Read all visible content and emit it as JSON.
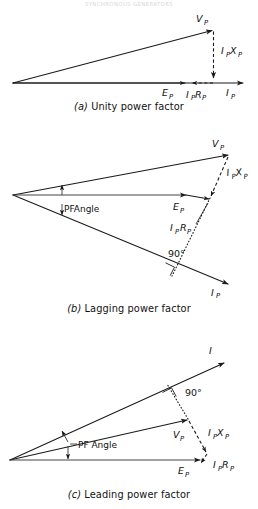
{
  "header": {
    "running_head": "SYNCHRONOUS GENERATORS"
  },
  "figure": {
    "diagrams": [
      {
        "id": "a",
        "caption_tag": "(a)",
        "caption_text": "Unity power factor",
        "labels": {
          "v_phase": "V",
          "v_phase_sub": "P",
          "e_phase": "E",
          "e_phase_sub": "P",
          "i_phase": "I",
          "i_phase_sub": "P",
          "ix_drop": "I",
          "ix_drop_sub1": "P",
          "ix_drop_mid": "X",
          "ix_drop_sub2": "P",
          "ir_drop": "I",
          "ir_drop_sub1": "P",
          "ir_drop_mid": "R",
          "ir_drop_sub2": "P"
        }
      },
      {
        "id": "b",
        "caption_tag": "(b)",
        "caption_text": "Lagging power factor",
        "labels": {
          "v_phase": "V",
          "v_phase_sub": "P",
          "e_phase": "E",
          "e_phase_sub": "P",
          "i_phase": "I",
          "i_phase_sub": "P",
          "ix_drop": "I",
          "ix_drop_sub1": "P",
          "ix_drop_mid": "X",
          "ix_drop_sub2": "P",
          "ir_drop": "I",
          "ir_drop_sub1": "P",
          "ir_drop_mid": "R",
          "ir_drop_sub2": "P",
          "pf_angle": "PFAngle",
          "right_angle": "90°"
        }
      },
      {
        "id": "c",
        "caption_tag": "(c)",
        "caption_text": "Leading power factor",
        "labels": {
          "v_phase": "V",
          "v_phase_sub": "P",
          "e_phase": "E",
          "e_phase_sub": "P",
          "i_phase": "I",
          "ix_drop": "I",
          "ix_drop_sub1": "P",
          "ix_drop_mid": "X",
          "ix_drop_sub2": "P",
          "ir_drop": "I",
          "ir_drop_sub1": "P",
          "ir_drop_mid": "R",
          "ir_drop_sub2": "P",
          "pf_angle": "PF Angle",
          "right_angle": "90°"
        }
      }
    ]
  },
  "colors": {
    "ink": "#1a1a1a",
    "paper": "#ffffff",
    "faint": "#d8d8d8"
  }
}
